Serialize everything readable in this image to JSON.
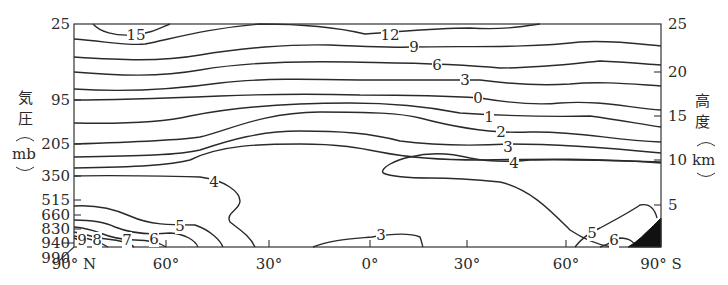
{
  "chart_data": {
    "type": "contour",
    "title": "",
    "x_axis": {
      "label": "",
      "ticks": [
        "90° N",
        "60°",
        "30°",
        "0°",
        "30°",
        "60°",
        "90° S"
      ],
      "range": [
        90,
        -90
      ]
    },
    "y_axis_left": {
      "label_chars": [
        "気",
        "圧"
      ],
      "unit": "mb",
      "ticks": [
        "25",
        "95",
        "205",
        "350",
        "515",
        "660",
        "830",
        "940",
        "990"
      ]
    },
    "y_axis_right": {
      "label_chars": [
        "高",
        "度"
      ],
      "unit": "km",
      "ticks": [
        "25",
        "20",
        "15",
        "10",
        "5"
      ],
      "range": [
        0,
        25
      ]
    },
    "contour_labels": [
      "15",
      "12",
      "9",
      "6",
      "3",
      "0",
      "1",
      "2",
      "3",
      "4",
      "4",
      "5",
      "6",
      "7",
      "8",
      "9",
      "3",
      "5",
      "6"
    ],
    "contour_levels": [
      15,
      12,
      9,
      6,
      3,
      0,
      1,
      2,
      3,
      4,
      5,
      6,
      7,
      8,
      9
    ],
    "annotations": [
      "Shaded terrain near 90°S surface (Antarctica)"
    ]
  }
}
